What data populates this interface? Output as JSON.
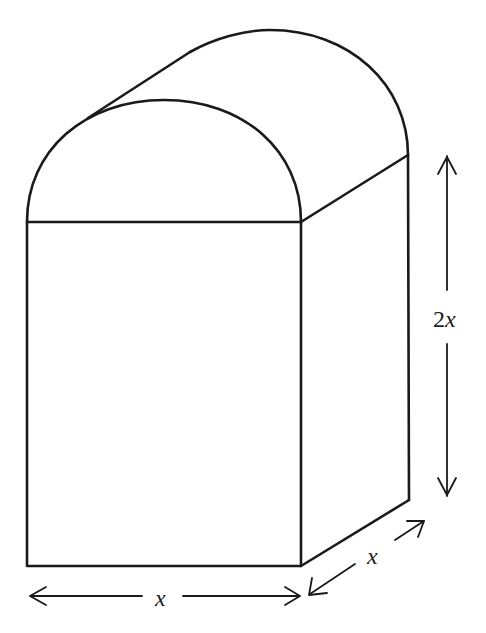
{
  "figure": {
    "stroke_color": "#1a1a1a",
    "background": "#ffffff"
  },
  "labels": {
    "front_width": "x",
    "depth": "x",
    "height_number": "2",
    "height_variable": "x"
  }
}
